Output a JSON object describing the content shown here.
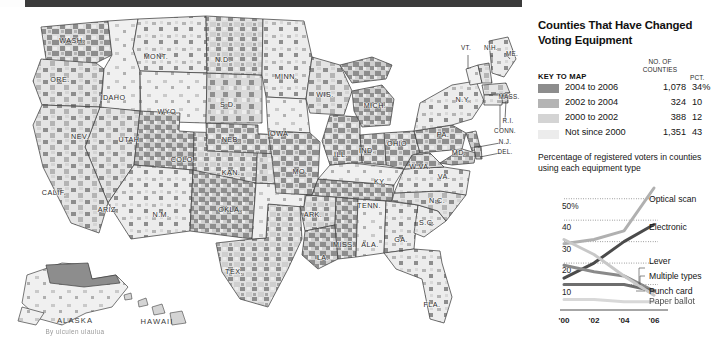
{
  "header": {
    "title": "Counties That Have Changed Voting Equipment"
  },
  "legend": {
    "key_header": "KEY TO MAP",
    "counties_header": "NO. OF COUNTIES",
    "pct_header": "PCT.",
    "rows": [
      {
        "label": "2004 to 2006",
        "counties": "1,078",
        "pct": "34%",
        "color": "#8d8d8d"
      },
      {
        "label": "2002 to 2004",
        "counties": "324",
        "pct": "10",
        "color": "#b4b4b4"
      },
      {
        "label": "2000 to 2002",
        "counties": "388",
        "pct": "12",
        "color": "#d4d4d4"
      },
      {
        "label": "Not since 2000",
        "counties": "1,351",
        "pct": "43",
        "color": "#ececec"
      }
    ]
  },
  "chart_section": {
    "subtitle": "Percentage of registered voters in counties using each equipment type"
  },
  "chart_data": {
    "type": "line",
    "title": "Percentage of registered voters in counties using each equipment type",
    "xlabel": "",
    "ylabel": "",
    "x": [
      "'00",
      "'02",
      "'04",
      "'06"
    ],
    "tick_labels": [
      "'00",
      "'02",
      "'04",
      "'06"
    ],
    "y_ticks": [
      "50%",
      "40",
      "30",
      "20",
      "10"
    ],
    "y_tick_values": [
      50,
      40,
      30,
      20,
      10
    ],
    "ylim": [
      0,
      55
    ],
    "grid": true,
    "legend_position": "right-inline",
    "series": [
      {
        "name": "Optical scan",
        "values": [
          29,
          31,
          35,
          55
        ],
        "color": "#b0b0b0"
      },
      {
        "name": "Electronic",
        "values": [
          13,
          20,
          30,
          38
        ],
        "color": "#4b4b4b"
      },
      {
        "name": "Lever",
        "values": [
          19,
          16,
          14,
          7
        ],
        "color": "#8a8a8a"
      },
      {
        "name": "Multiple types",
        "values": [
          10,
          10,
          10,
          7
        ],
        "color": "#6e6e6e"
      },
      {
        "name": "Punch card",
        "values": [
          31,
          24,
          14,
          5
        ],
        "color": "#c8c8c8"
      },
      {
        "name": "Paper ballot",
        "values": [
          3,
          3,
          2,
          2
        ],
        "color": "#d8d8d8"
      }
    ]
  },
  "map": {
    "states": [
      {
        "abbr": "WASH.",
        "x": 72,
        "y": 36
      },
      {
        "abbr": "ORE.",
        "x": 60,
        "y": 75
      },
      {
        "abbr": "IDAHO",
        "x": 113,
        "y": 93
      },
      {
        "abbr": "MONT.",
        "x": 156,
        "y": 52
      },
      {
        "abbr": "WYO.",
        "x": 168,
        "y": 107
      },
      {
        "abbr": "NEV.",
        "x": 80,
        "y": 132
      },
      {
        "abbr": "UTAH",
        "x": 129,
        "y": 135
      },
      {
        "abbr": "COLO.",
        "x": 183,
        "y": 155
      },
      {
        "abbr": "CALIF.",
        "x": 54,
        "y": 188
      },
      {
        "abbr": "ARIZ.",
        "x": 108,
        "y": 205
      },
      {
        "abbr": "N.M.",
        "x": 161,
        "y": 210
      },
      {
        "abbr": "TEX.",
        "x": 234,
        "y": 267
      },
      {
        "abbr": "OKLA.",
        "x": 230,
        "y": 205
      },
      {
        "abbr": "KAN.",
        "x": 231,
        "y": 168
      },
      {
        "abbr": "NEB.",
        "x": 231,
        "y": 135
      },
      {
        "abbr": "S.D.",
        "x": 228,
        "y": 100
      },
      {
        "abbr": "N.D.",
        "x": 223,
        "y": 55
      },
      {
        "abbr": "MINN.",
        "x": 286,
        "y": 72
      },
      {
        "abbr": "IOWA",
        "x": 278,
        "y": 129
      },
      {
        "abbr": "MO.",
        "x": 300,
        "y": 167
      },
      {
        "abbr": "ARK.",
        "x": 313,
        "y": 210
      },
      {
        "abbr": "LA.",
        "x": 323,
        "y": 253
      },
      {
        "abbr": "MISS.",
        "x": 344,
        "y": 240
      },
      {
        "abbr": "ALA.",
        "x": 370,
        "y": 240
      },
      {
        "abbr": "GA.",
        "x": 401,
        "y": 235
      },
      {
        "abbr": "FLA.",
        "x": 432,
        "y": 300
      },
      {
        "abbr": "TENN.",
        "x": 369,
        "y": 201
      },
      {
        "abbr": "KY.",
        "x": 380,
        "y": 177
      },
      {
        "abbr": "S.C.",
        "x": 427,
        "y": 218
      },
      {
        "abbr": "N.C.",
        "x": 437,
        "y": 196
      },
      {
        "abbr": "VA.",
        "x": 444,
        "y": 172
      },
      {
        "abbr": "W.VA.",
        "x": 420,
        "y": 162
      },
      {
        "abbr": "OHIO",
        "x": 397,
        "y": 139
      },
      {
        "abbr": "IND.",
        "x": 367,
        "y": 146
      },
      {
        "abbr": "ILL.",
        "x": 341,
        "y": 150
      },
      {
        "abbr": "WIS.",
        "x": 325,
        "y": 90
      },
      {
        "abbr": "MICH.",
        "x": 375,
        "y": 101
      },
      {
        "abbr": "PA.",
        "x": 443,
        "y": 130
      },
      {
        "abbr": "N.Y.",
        "x": 463,
        "y": 95
      },
      {
        "abbr": "MD.",
        "x": 459,
        "y": 148
      }
    ],
    "small_states": [
      {
        "abbr": "VT.",
        "x": 466,
        "y": 43
      },
      {
        "abbr": "N.H.",
        "x": 491,
        "y": 43
      },
      {
        "abbr": "ME.",
        "x": 512,
        "y": 49
      },
      {
        "abbr": "MASS.",
        "x": 509,
        "y": 92
      },
      {
        "abbr": "R.I.",
        "x": 508,
        "y": 116
      },
      {
        "abbr": "CONN.",
        "x": 505,
        "y": 126
      },
      {
        "abbr": "N.J.",
        "x": 505,
        "y": 137
      },
      {
        "abbr": "DEL.",
        "x": 505,
        "y": 147
      }
    ],
    "insets": [
      {
        "label": "ALASKA",
        "x": 75,
        "y": 316
      },
      {
        "label": "HAWAII",
        "x": 157,
        "y": 317
      }
    ],
    "credit": "By ulculen ulaulua"
  }
}
